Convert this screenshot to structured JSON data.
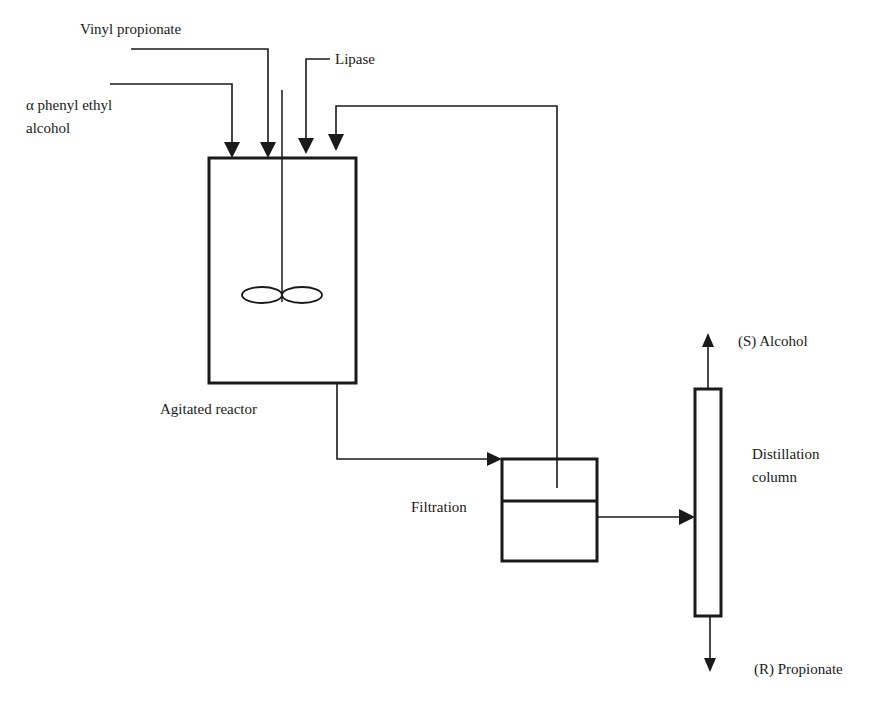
{
  "diagram": {
    "type": "process-flow",
    "colors": {
      "stroke": "#1a1a1a",
      "background": "#ffffff"
    },
    "inputs": {
      "vinyl_propionate": "Vinyl propionate",
      "alpha_phenyl_line1": "α phenyl ethyl",
      "alpha_phenyl_line2": "alcohol",
      "lipase": "Lipase"
    },
    "units": {
      "reactor": "Agitated reactor",
      "filtration": "Filtration",
      "column_line1": "Distillation",
      "column_line2": "column"
    },
    "outputs": {
      "top": "(S) Alcohol",
      "bottom": "(R) Propionate"
    },
    "streams": [
      {
        "from": "Vinyl propionate",
        "to": "Agitated reactor"
      },
      {
        "from": "α phenyl ethyl alcohol",
        "to": "Agitated reactor"
      },
      {
        "from": "Lipase",
        "to": "Agitated reactor"
      },
      {
        "from": "Filtration",
        "to": "Agitated reactor",
        "kind": "recycle"
      },
      {
        "from": "Agitated reactor",
        "to": "Filtration"
      },
      {
        "from": "Filtration",
        "to": "Distillation column"
      },
      {
        "from": "Distillation column",
        "to": "(S) Alcohol"
      },
      {
        "from": "Distillation column",
        "to": "(R) Propionate"
      }
    ]
  }
}
